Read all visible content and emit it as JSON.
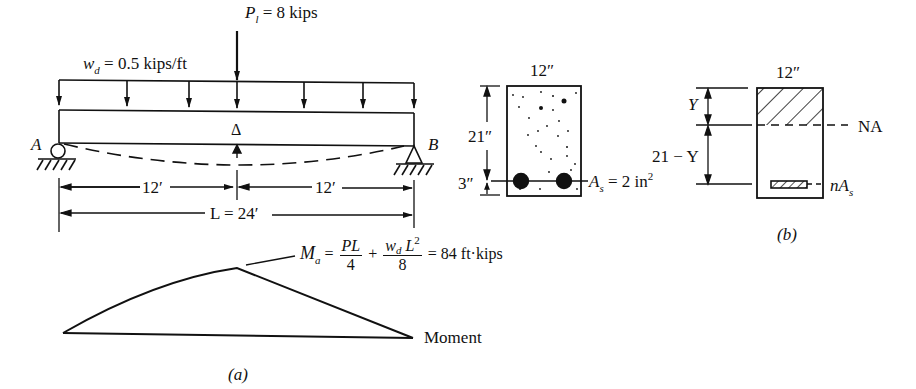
{
  "figure_a": {
    "load_point": {
      "symbol": "P",
      "subscript": "l",
      "value_text": "= 8 kips"
    },
    "load_distributed": {
      "symbol": "w",
      "subscript": "d",
      "value_text": "= 0.5 kips/ft"
    },
    "deflection_symbol": "Δ",
    "support_left": "A",
    "support_right": "B",
    "dim_left": "12′",
    "dim_right": "12′",
    "dim_total": "L = 24′",
    "moment_eq": {
      "lhs": "M",
      "lhs_sub": "a",
      "eq1": "=",
      "frac1_num": "PL",
      "frac1_den": "4",
      "plus": "+",
      "frac2_num_w": "w",
      "frac2_num_sub": "d",
      "frac2_num_L": "L",
      "frac2_num_sup": "2",
      "frac2_den": "8",
      "result": "= 84 ft·kips"
    },
    "moment_label": "Moment",
    "caption": "(a)"
  },
  "section_1": {
    "width_label": "12″",
    "depth_label": "21″",
    "cover_label": "3″",
    "steel_label": {
      "symbol": "A",
      "subscript": "s",
      "value_text": "= 2 in",
      "sup": "2"
    }
  },
  "section_2": {
    "width_label": "12″",
    "y_label": "Y",
    "lower_label": "21 − Y",
    "na_label": "NA",
    "transformed_label": {
      "prefix": "n",
      "symbol": "A",
      "subscript": "s"
    },
    "caption": "(b)"
  }
}
